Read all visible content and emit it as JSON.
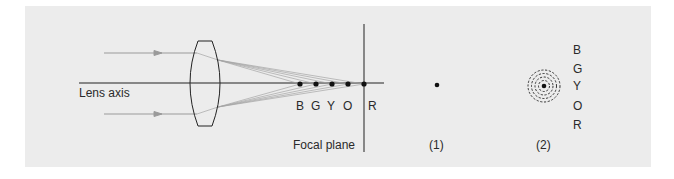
{
  "diagram": {
    "labels": {
      "lens_axis": "Lens axis",
      "focal_plane": "Focal plane",
      "case_1": "(1)",
      "case_2": "(2)"
    },
    "focal_points": [
      {
        "label": "B",
        "x": 300
      },
      {
        "label": "G",
        "x": 316
      },
      {
        "label": "Y",
        "x": 332
      },
      {
        "label": "O",
        "x": 348
      },
      {
        "label": "R",
        "x": 364
      }
    ],
    "ring_labels": [
      "B",
      "G",
      "Y",
      "O",
      "R"
    ],
    "colors": {
      "panel_background": "#ececec",
      "line": "#222222",
      "ray": "#9a9a9a"
    }
  }
}
